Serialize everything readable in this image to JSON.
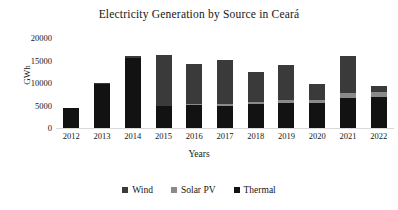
{
  "chart_data": {
    "type": "bar",
    "subtype": "stacked-column",
    "title": "Electricity Generation by Source in Ceará",
    "xlabel": "Years",
    "ylabel": "GWh",
    "categories": [
      "2012",
      "2013",
      "2014",
      "2015",
      "2016",
      "2017",
      "2018",
      "2019",
      "2020",
      "2021",
      "2022"
    ],
    "ylim": [
      0,
      20000
    ],
    "yticks": [
      0,
      5000,
      10000,
      15000,
      20000
    ],
    "ytick_labels": [
      "0",
      "5000",
      "10000",
      "15000",
      "20000"
    ],
    "grid": false,
    "legend_position": "bottom",
    "series": [
      {
        "name": "Thermal",
        "color": "#121212",
        "values": [
          4500,
          9700,
          15600,
          4800,
          5100,
          5000,
          5300,
          5600,
          5500,
          6600,
          6900
        ]
      },
      {
        "name": "Solar PV",
        "color": "#8a8a8a",
        "values": [
          0,
          0,
          0,
          200,
          300,
          400,
          500,
          600,
          700,
          1100,
          1200
        ]
      },
      {
        "name": "Wind",
        "color": "#3a3a3a",
        "values": [
          0,
          300,
          400,
          11300,
          8800,
          9800,
          6700,
          7800,
          3600,
          8300,
          1200
        ]
      }
    ],
    "totals": [
      4500,
      10000,
      16000,
      16300,
      14200,
      15200,
      12500,
      14000,
      9800,
      16000,
      9300
    ]
  },
  "legend": {
    "items": [
      {
        "label": "Wind",
        "swatch": "legend-swatch-wind"
      },
      {
        "label": "Solar PV",
        "swatch": "legend-swatch-solar"
      },
      {
        "label": "Thermal",
        "swatch": "legend-swatch-thermal"
      }
    ]
  }
}
